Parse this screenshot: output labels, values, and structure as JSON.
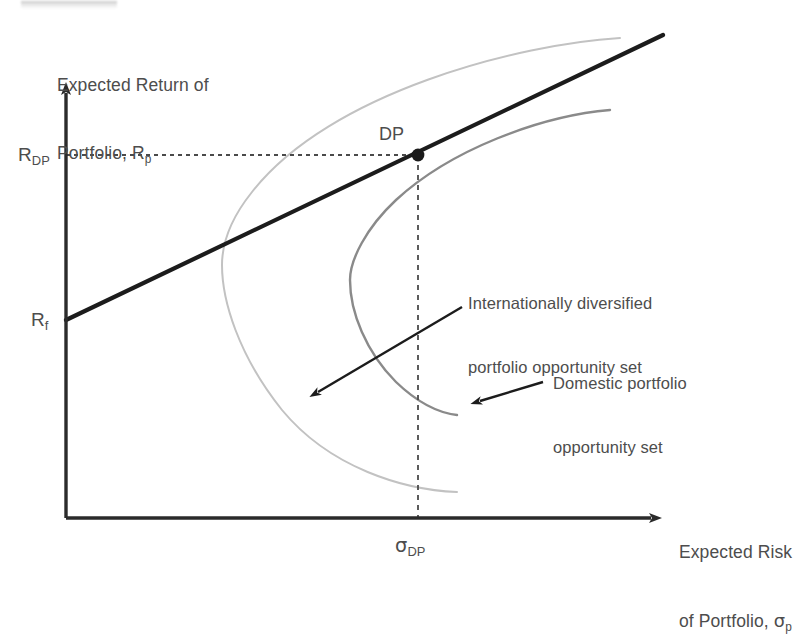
{
  "figure": {
    "type": "diagram",
    "background_color": "#ffffff",
    "ink_color": "#2b2b2b",
    "text_color": "#4d4d4d"
  },
  "axes": {
    "y_label_line1": "Expected Return of",
    "y_label_line2_pre": "Portfolio, R",
    "y_label_line2_sub": "p",
    "x_label_line1": "Expected Risk",
    "x_label_line2_pre": "of Portfolio, ",
    "x_label_line2_sigma": "σ",
    "x_label_line2_sub": "p",
    "origin_px": [
      66,
      518
    ],
    "y_axis_top_px": [
      66,
      85
    ],
    "x_axis_right_px": [
      663,
      518
    ],
    "axis_color": "#2b2b2b"
  },
  "ticks": {
    "y": [
      {
        "name": "R_DP",
        "text_pre": "R",
        "text_sub": "DP",
        "px": [
          66,
          155
        ]
      },
      {
        "name": "R_f",
        "text_pre": "R",
        "text_sub": "f",
        "px": [
          66,
          320
        ]
      }
    ],
    "x": [
      {
        "name": "sigma_DP",
        "text_sigma": "σ",
        "text_sub": "DP",
        "px": [
          418,
          518
        ]
      }
    ]
  },
  "point": {
    "label": "DP",
    "name": "tangency-point-dp",
    "px": [
      418,
      155
    ],
    "color": "#1a1a1a"
  },
  "guides": {
    "horizontal": {
      "from_px": [
        66,
        155
      ],
      "to_px": [
        418,
        155
      ],
      "style": "dashed",
      "color": "#4a4a4a"
    },
    "vertical": {
      "from_px": [
        418,
        155
      ],
      "to_px": [
        418,
        518
      ],
      "style": "dashed",
      "color": "#4a4a4a"
    }
  },
  "capital_market_line": {
    "name": "capital-market-line",
    "from_px": [
      66,
      320
    ],
    "to_px": [
      663,
      35
    ],
    "color": "#1c1c1c",
    "width_px": 4
  },
  "curves": [
    {
      "name": "international-opportunity-set",
      "label": "Internationally diversified portfolio opportunity set",
      "color": "#c2c2c2",
      "width_px": 2,
      "vertex_px": [
        222,
        265
      ],
      "upper_end_px": [
        620,
        38
      ],
      "lower_end_px": [
        457,
        492
      ]
    },
    {
      "name": "domestic-opportunity-set",
      "label": "Domestic portfolio opportunity set",
      "color": "#8a8a8a",
      "width_px": 2.4,
      "vertex_px": [
        350,
        280
      ],
      "upper_end_px": [
        610,
        110
      ],
      "lower_end_px": [
        457,
        415
      ]
    }
  ],
  "annotations": [
    {
      "name": "annotation-international",
      "line1": "Internationally diversified",
      "line2": "portfolio opportunity set",
      "text_px": [
        468,
        258
      ],
      "arrow_from_px": [
        462,
        307
      ],
      "arrow_to_px": [
        312,
        396
      ]
    },
    {
      "name": "annotation-domestic",
      "line1": "Domestic portfolio",
      "line2": "opportunity set",
      "text_px": [
        553,
        337
      ],
      "arrow_from_px": [
        543,
        382
      ],
      "arrow_to_px": [
        473,
        404
      ]
    }
  ],
  "artifact": {
    "name": "scan-artifact",
    "description": "faint cropped scan remnant"
  }
}
